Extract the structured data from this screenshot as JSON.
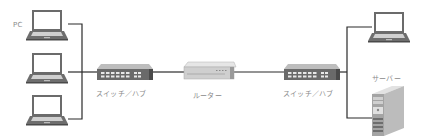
{
  "diagram": {
    "type": "network-topology",
    "colors": {
      "line": "#2a2a2a",
      "device_dark": "#555555",
      "device_mid": "#8c8c8c",
      "device_light": "#d8d8d8",
      "label": "#8a8a8a"
    },
    "nodes": [
      {
        "id": "pc1",
        "kind": "laptop",
        "label": "PC"
      },
      {
        "id": "pc2",
        "kind": "laptop",
        "label": ""
      },
      {
        "id": "pc3",
        "kind": "laptop",
        "label": ""
      },
      {
        "id": "switch1",
        "kind": "switch",
        "label": "スイッチ／ハブ"
      },
      {
        "id": "router",
        "kind": "router",
        "label": "ルーター"
      },
      {
        "id": "switch2",
        "kind": "switch",
        "label": "スイッチ／ハブ"
      },
      {
        "id": "pc4",
        "kind": "laptop",
        "label": ""
      },
      {
        "id": "server",
        "kind": "server",
        "label": "サーバー"
      }
    ],
    "edges": [
      [
        "pc1",
        "switch1"
      ],
      [
        "pc2",
        "switch1"
      ],
      [
        "pc3",
        "switch1"
      ],
      [
        "switch1",
        "router"
      ],
      [
        "router",
        "switch2"
      ],
      [
        "switch2",
        "pc4"
      ],
      [
        "switch2",
        "server"
      ]
    ]
  }
}
